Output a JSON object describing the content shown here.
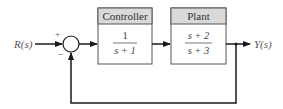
{
  "diagram": {
    "type": "feedback-block-diagram",
    "input_label": "R(s)",
    "output_label": "Y(s)",
    "summing_junction": {
      "plus_sign": "+",
      "minus_sign": "−"
    },
    "blocks": [
      {
        "title": "Controller",
        "numerator": "1",
        "denominator": "s + 1"
      },
      {
        "title": "Plant",
        "numerator": "s + 2",
        "denominator": "s + 3"
      }
    ],
    "feedback": "unity negative feedback",
    "colors": {
      "line": "#1a1a1a",
      "header_fill": "#d9d9d9",
      "box_fill": "#ffffff",
      "text": "#444444"
    }
  }
}
